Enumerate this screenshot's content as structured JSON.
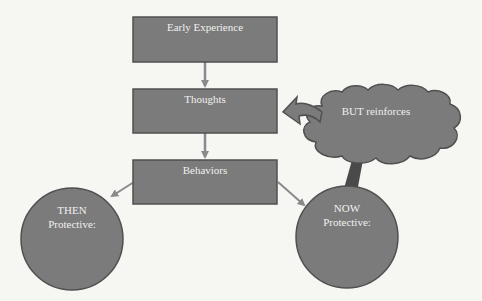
{
  "colors": {
    "background": "#f6f6f3",
    "shape_fill": "#7b7b7b",
    "shape_border": "#505050",
    "arrow": "#8a8a8a",
    "text": "#f0f0f0",
    "stem": "#4a4a4a"
  },
  "nodes": {
    "early_experience": {
      "label": "Early Experience",
      "shape": "rectangle"
    },
    "thoughts": {
      "label": "Thoughts",
      "shape": "rectangle"
    },
    "behaviors": {
      "label": "Behaviors",
      "shape": "rectangle"
    },
    "but_reinforces": {
      "label": "BUT reinforces",
      "shape": "cloud"
    },
    "then_protective": {
      "line1": "THEN",
      "line2": "Protective:",
      "shape": "circle"
    },
    "now_protective": {
      "line1": "NOW",
      "line2": "Protective:",
      "shape": "circle"
    }
  },
  "edges": [
    {
      "from": "Early Experience",
      "to": "Thoughts",
      "type": "arrow"
    },
    {
      "from": "Thoughts",
      "to": "Behaviors",
      "type": "arrow"
    },
    {
      "from": "Behaviors",
      "to": "THEN Protective:",
      "type": "arrow"
    },
    {
      "from": "Behaviors",
      "to": "NOW Protective:",
      "type": "arrow"
    },
    {
      "from": "BUT reinforces",
      "to": "Thoughts",
      "type": "curved-block-arrow"
    },
    {
      "from": "NOW Protective:",
      "to": "BUT reinforces",
      "type": "stem"
    }
  ]
}
